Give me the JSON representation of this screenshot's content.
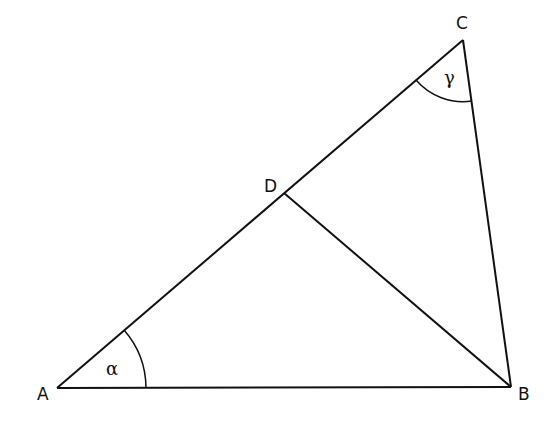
{
  "diagram": {
    "title": "",
    "points": {
      "A": {
        "label": "A",
        "x": 57,
        "y": 388
      },
      "B": {
        "label": "B",
        "x": 511,
        "y": 387
      },
      "C": {
        "label": "C",
        "x": 463,
        "y": 40
      },
      "D": {
        "label": "D",
        "x": 284,
        "y": 193
      }
    },
    "segments": [
      "AB",
      "BC",
      "CA",
      "DB"
    ],
    "angles": {
      "alpha": {
        "label": "α",
        "vertex": "A"
      },
      "gamma": {
        "label": "γ",
        "vertex": "C"
      }
    },
    "colors": {
      "stroke": "#111111",
      "background": "#ffffff"
    }
  }
}
